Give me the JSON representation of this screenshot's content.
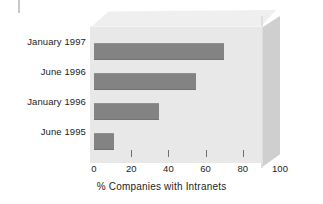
{
  "chart_data": {
    "type": "bar",
    "orientation": "horizontal",
    "title": "",
    "xlabel": "% Companies with Intranets",
    "ylabel": "",
    "categories": [
      "January 1997",
      "June 1996",
      "January 1996",
      "June 1995"
    ],
    "values": [
      70,
      55,
      35,
      11
    ],
    "xlim": [
      0,
      100
    ],
    "xticks": [
      0,
      20,
      40,
      60,
      80,
      100
    ],
    "xtick_labels": [
      "0",
      "20",
      "40",
      "60",
      "80",
      "100"
    ],
    "grid": false,
    "legend": null,
    "style": {
      "bar_color": "#838383",
      "plot_face_color": "#e8e8e8",
      "slab_top_color": "#efefef",
      "slab_side_color": "#cfcfcf",
      "background_color": "#ffffff",
      "text_color": "#1d1d1d"
    }
  }
}
